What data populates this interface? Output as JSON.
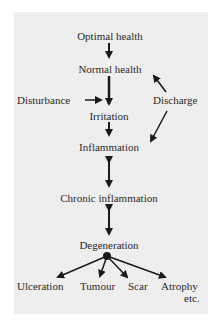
{
  "diagram": {
    "nodes": {
      "optimal_health": "Optimal health",
      "normal_health": "Normal health",
      "disturbance": "Disturbance",
      "discharge": "Discharge",
      "irritation": "Irritation",
      "inflammation": "Inflammation",
      "chronic_inflammation": "Chronic inflammation",
      "degeneration": "Degeneration",
      "ulceration": "Ulceration",
      "tumour": "Tumour",
      "scar": "Scar",
      "atrophy": "Atrophy",
      "etc": "etc."
    },
    "edges": [
      {
        "from": "Optimal health",
        "to": "Normal health",
        "type": "one-way"
      },
      {
        "from": "Normal health",
        "to": "Irritation",
        "type": "one-way"
      },
      {
        "from": "Disturbance",
        "to": "Irritation",
        "type": "one-way"
      },
      {
        "from": "Discharge",
        "to": "Normal health",
        "type": "one-way"
      },
      {
        "from": "Discharge",
        "to": "Inflammation",
        "type": "one-way"
      },
      {
        "from": "Irritation",
        "to": "Inflammation",
        "type": "one-way"
      },
      {
        "from": "Inflammation",
        "to": "Chronic inflammation",
        "type": "two-way"
      },
      {
        "from": "Chronic inflammation",
        "to": "Degeneration",
        "type": "two-way"
      },
      {
        "from": "Degeneration",
        "to": "Ulceration",
        "type": "one-way"
      },
      {
        "from": "Degeneration",
        "to": "Tumour",
        "type": "one-way"
      },
      {
        "from": "Degeneration",
        "to": "Scar",
        "type": "one-way"
      },
      {
        "from": "Degeneration",
        "to": "Atrophy etc.",
        "type": "one-way"
      }
    ],
    "colors": {
      "panel": "#eeeeee",
      "ink": "#1a1a1a"
    }
  }
}
